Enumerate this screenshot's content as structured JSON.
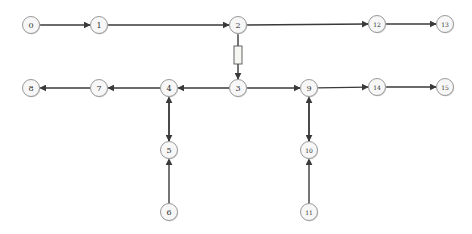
{
  "diagram": {
    "type": "directed-graph",
    "colors": {
      "node_fill": "#f7f7f7",
      "node_stroke": "#9a9a9a",
      "edge": "#3a3a3a",
      "label": "#333333",
      "box_fill": "#f6f6f2"
    },
    "node_radius": 8.5,
    "nodes": [
      {
        "id": "0",
        "label": "0",
        "x": 31,
        "y": 25,
        "size": 8
      },
      {
        "id": "1",
        "label": "1",
        "x": 99,
        "y": 25,
        "size": 8
      },
      {
        "id": "2",
        "label": "2",
        "x": 238,
        "y": 25,
        "size": 8
      },
      {
        "id": "12",
        "label": "12",
        "x": 377,
        "y": 24,
        "size": 6
      },
      {
        "id": "13",
        "label": "13",
        "x": 445,
        "y": 24,
        "size": 6
      },
      {
        "id": "8",
        "label": "8",
        "x": 31,
        "y": 88,
        "size": 8
      },
      {
        "id": "7",
        "label": "7",
        "x": 99,
        "y": 88,
        "size": 8
      },
      {
        "id": "4",
        "label": "4",
        "x": 169,
        "y": 88,
        "size": 8
      },
      {
        "id": "3",
        "label": "3",
        "x": 238,
        "y": 88,
        "size": 8
      },
      {
        "id": "9",
        "label": "9",
        "x": 309,
        "y": 88,
        "size": 8
      },
      {
        "id": "14",
        "label": "14",
        "x": 377,
        "y": 87,
        "size": 6
      },
      {
        "id": "15",
        "label": "15",
        "x": 445,
        "y": 87,
        "size": 6
      },
      {
        "id": "5",
        "label": "5",
        "x": 169,
        "y": 150,
        "size": 8
      },
      {
        "id": "10",
        "label": "10",
        "x": 309,
        "y": 150,
        "size": 6
      },
      {
        "id": "6",
        "label": "6",
        "x": 169,
        "y": 212,
        "size": 8
      },
      {
        "id": "11",
        "label": "11",
        "x": 309,
        "y": 212,
        "size": 6
      }
    ],
    "edges": [
      {
        "from": "0",
        "to": "1"
      },
      {
        "from": "1",
        "to": "2"
      },
      {
        "from": "2",
        "to": "12"
      },
      {
        "from": "12",
        "to": "13"
      },
      {
        "from": "2",
        "to": "3",
        "has_box": true
      },
      {
        "from": "3",
        "to": "4"
      },
      {
        "from": "4",
        "to": "7"
      },
      {
        "from": "7",
        "to": "8"
      },
      {
        "from": "3",
        "to": "9"
      },
      {
        "from": "9",
        "to": "14"
      },
      {
        "from": "14",
        "to": "15"
      },
      {
        "from": "4",
        "to": "5"
      },
      {
        "from": "5",
        "to": "4"
      },
      {
        "from": "6",
        "to": "5"
      },
      {
        "from": "9",
        "to": "10"
      },
      {
        "from": "10",
        "to": "9"
      },
      {
        "from": "11",
        "to": "10"
      }
    ],
    "edge_box": {
      "x": 234,
      "y": 46,
      "width": 8,
      "height": 18
    }
  }
}
